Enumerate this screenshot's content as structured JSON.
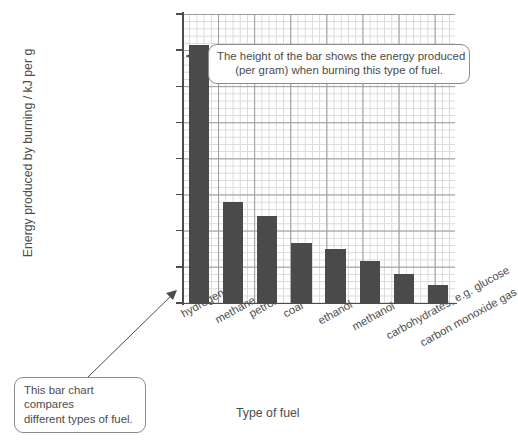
{
  "chart_data": {
    "type": "bar",
    "title": "",
    "xlabel": "Type of fuel",
    "ylabel": "Energy produced by burning / kJ per g",
    "ylim": [
      0,
      160
    ],
    "ytick_values": [
      0,
      20,
      40,
      60,
      80,
      100,
      120,
      140,
      160
    ],
    "ytick_labels": [
      "0",
      "20",
      "40",
      "60",
      "80",
      "100",
      "120",
      "140",
      "160"
    ],
    "grid": true,
    "legend": "none",
    "categories": [
      "hydrogen gas",
      "methane gas",
      "petrol",
      "coal",
      "ethanol",
      "methanol",
      "carbohydrates, e.g. glucose",
      "carbon monoxide gas"
    ],
    "values": [
      143,
      56,
      48,
      33,
      30,
      23,
      16,
      10
    ],
    "bar_color": "#4a4a4a",
    "annotations": [
      {
        "id": "bar-height-note",
        "lines": [
          "The height of the bar shows the energy produced",
          "(per gram) when burning this type of fuel."
        ],
        "points_to": "hydrogen gas bar"
      },
      {
        "id": "chart-purpose-note",
        "lines": [
          "This bar chart compares",
          "different types of fuel."
        ],
        "points_to": "chart plot area"
      }
    ]
  },
  "axis": {
    "y_title": "Energy produced by burning / kJ per g",
    "x_title": "Type of fuel"
  },
  "callouts": {
    "top": {
      "line1": "The height of the bar shows the energy produced",
      "line2": "(per gram) when burning this type of fuel."
    },
    "bottom": {
      "line1": "This bar chart compares",
      "line2": "different types of fuel."
    }
  },
  "colors": {
    "bar": "#4a4a4a",
    "text": "#4c4c4c",
    "grid_minor": "#d8d8d8",
    "grid_major": "#9a9a9a",
    "callout_border": "#8c8c8c"
  }
}
